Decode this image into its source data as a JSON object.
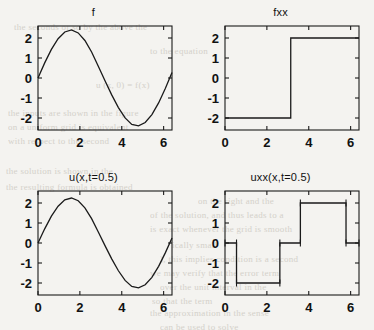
{
  "figure": {
    "background_color": "#f4f3f0",
    "line_color": "#1a1a1a",
    "panels": [
      {
        "name": "f",
        "title": "f",
        "position": "top-left"
      },
      {
        "name": "fxx",
        "title": "fxx",
        "position": "top-right"
      },
      {
        "name": "u",
        "title": "u(x,t=0.5)",
        "position": "bottom-left"
      },
      {
        "name": "uxx",
        "title": "uxx(x,t=0.5)",
        "position": "bottom-right"
      }
    ]
  },
  "scan_bleed": {
    "lines": [
      {
        "text": "the  seconds  or  so  by  the  above  the",
        "x": 14,
        "y": 22
      },
      {
        "text": "to  the  equation",
        "x": 150,
        "y": 46
      },
      {
        "text": "u (x, 0) = f(x)",
        "x": 96,
        "y": 80
      },
      {
        "text": "the  inputs  are  shown  in  the  figure",
        "x": 8,
        "y": 108
      },
      {
        "text": "on  a  uniform  grid  is  equivalent",
        "x": 8,
        "y": 122
      },
      {
        "text": "with  respect  to  the  second",
        "x": 8,
        "y": 136
      },
      {
        "text": "the  solution  is  shown  in  the",
        "x": 6,
        "y": 166
      },
      {
        "text": "the  resulting  formula  is  obtained",
        "x": 6,
        "y": 182
      },
      {
        "text": "on  the  right  and  the",
        "x": 198,
        "y": 196
      },
      {
        "text": "of  the  solution,  and  thus  leads  to  a",
        "x": 150,
        "y": 210
      },
      {
        "text": "is  exact  whenever  the  grid  is  smooth",
        "x": 150,
        "y": 224
      },
      {
        "text": "ically  small",
        "x": 172,
        "y": 240
      },
      {
        "text": "), this  implies  condition  is  a  second",
        "x": 160,
        "y": 254
      },
      {
        "text": "we  may  verify  that  the  error  term",
        "x": 150,
        "y": 268
      },
      {
        "text": "over  the  unit  interval  in  the",
        "x": 160,
        "y": 282
      },
      {
        "text": "so  that  the  term",
        "x": 152,
        "y": 296
      },
      {
        "text": "the  approximation  in  the  sense",
        "x": 150,
        "y": 308
      },
      {
        "text": "can  be  used  to  solve",
        "x": 160,
        "y": 322
      }
    ]
  },
  "chart_data": [
    {
      "type": "line",
      "name": "f",
      "title": "f",
      "xlabel": "",
      "ylabel": "",
      "xlim": [
        0,
        6.4
      ],
      "ylim": [
        -2.6,
        2.6
      ],
      "xticks": [
        0,
        2,
        4,
        6
      ],
      "yticks": [
        2,
        1,
        0,
        -1,
        -2
      ],
      "grid": false,
      "legend": null,
      "function": "2.4*sin(x)",
      "amplitude": 2.4,
      "x": [
        0,
        0.32,
        0.64,
        0.96,
        1.28,
        1.6,
        1.92,
        2.24,
        2.56,
        2.88,
        3.2,
        3.52,
        3.84,
        4.16,
        4.48,
        4.8,
        5.12,
        5.44,
        5.76,
        6.08,
        6.4
      ],
      "y": [
        0,
        0.755,
        1.432,
        1.963,
        2.3,
        2.4,
        2.254,
        1.875,
        1.3,
        0.59,
        -0.139,
        -0.845,
        -1.48,
        -1.995,
        -2.32,
        -2.396,
        -2.226,
        -1.83,
        -1.245,
        -0.527,
        0.27
      ]
    },
    {
      "type": "line",
      "name": "fxx",
      "title": "fxx",
      "xlabel": "",
      "ylabel": "",
      "xlim": [
        0,
        6.4
      ],
      "ylim": [
        -2.6,
        2.6
      ],
      "xticks": [
        0,
        2,
        4,
        6
      ],
      "yticks": [
        2,
        1,
        0,
        -1,
        -2
      ],
      "grid": false,
      "legend": null,
      "function": "step: -2 for x<pi, +2 for x>pi",
      "step_x": 3.14,
      "x": [
        0,
        3.14,
        3.14,
        6.4
      ],
      "y": [
        -2,
        -2,
        2,
        2
      ]
    },
    {
      "type": "line",
      "name": "u",
      "title": "u(x,t=0.5)",
      "xlabel": "",
      "ylabel": "",
      "xlim": [
        0,
        6.4
      ],
      "ylim": [
        -2.6,
        2.6
      ],
      "xticks": [
        0,
        2,
        4,
        6
      ],
      "yticks": [
        2,
        1,
        0,
        -1,
        -2
      ],
      "grid": false,
      "legend": null,
      "function": "2.25*sin(x) damped",
      "amplitude": 2.25,
      "x": [
        0,
        0.32,
        0.64,
        0.96,
        1.28,
        1.6,
        1.92,
        2.24,
        2.56,
        2.88,
        3.2,
        3.52,
        3.84,
        4.16,
        4.48,
        4.8,
        5.12,
        5.44,
        5.76,
        6.08,
        6.4
      ],
      "y": [
        0,
        0.708,
        1.343,
        1.841,
        2.157,
        2.25,
        2.113,
        1.758,
        1.219,
        0.553,
        -0.13,
        -0.792,
        -1.388,
        -1.871,
        -2.175,
        -2.246,
        -2.087,
        -1.716,
        -1.167,
        -0.494,
        0.253
      ]
    },
    {
      "type": "line",
      "name": "uxx",
      "title": "uxx(x,t=0.5)",
      "xlabel": "",
      "ylabel": "",
      "xlim": [
        0,
        6.4
      ],
      "ylim": [
        -2.6,
        2.6
      ],
      "xticks": [
        0,
        2,
        4,
        6
      ],
      "yticks": [
        2,
        1,
        0,
        -1,
        -2
      ],
      "grid": false,
      "legend": null,
      "function": "smoothed square wave, levels 0/-2/0/+2/0",
      "x": [
        0,
        0.55,
        0.55,
        2.62,
        2.62,
        3.6,
        3.6,
        5.78,
        5.78,
        6.4
      ],
      "y": [
        0,
        0,
        -2,
        -2,
        0,
        0,
        2,
        2,
        0,
        0
      ],
      "markers": [
        {
          "x": 0.0,
          "y": 0
        },
        {
          "x": 0.55,
          "y": 0
        },
        {
          "x": 0.55,
          "y": -2
        },
        {
          "x": 2.62,
          "y": -2
        },
        {
          "x": 2.62,
          "y": 0
        },
        {
          "x": 3.6,
          "y": 0
        },
        {
          "x": 3.6,
          "y": 2
        },
        {
          "x": 5.78,
          "y": 2
        },
        {
          "x": 5.78,
          "y": 0
        },
        {
          "x": 6.4,
          "y": 0
        }
      ]
    }
  ]
}
